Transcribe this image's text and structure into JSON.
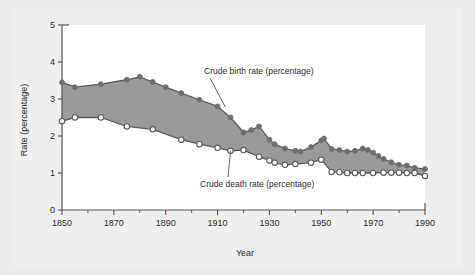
{
  "figure": {
    "background_color": "#ebebeb",
    "panel_color": "#efefef",
    "plot_area_color": "#ffffff",
    "axis_color": "#555555"
  },
  "chart_data": {
    "type": "line",
    "title": "",
    "xlabel": "Year",
    "ylabel": "Rate (percentage)",
    "xlim": [
      1850,
      1990
    ],
    "ylim": [
      0,
      5
    ],
    "xticks": [
      1850,
      1870,
      1890,
      1910,
      1930,
      1950,
      1970,
      1990
    ],
    "xtick_labels": [
      "1850",
      "1870",
      "1890",
      "1910",
      "1930",
      "1950",
      "1970",
      "1990"
    ],
    "x_minor_ticks": [
      1860,
      1880,
      1900,
      1920,
      1940,
      1960,
      1980
    ],
    "yticks": [
      0,
      1,
      2,
      3,
      4,
      5
    ],
    "ytick_labels": [
      "0",
      "1",
      "2",
      "3",
      "4",
      "5"
    ],
    "grid": false,
    "legend": "none",
    "fill_between_color": "#9a9a9a",
    "annotations": [
      {
        "text": "Crude birth rate (percentage)",
        "x_px": 204,
        "y_px": 74,
        "leader_to_x": 1913,
        "leader_to_y": 2.78
      },
      {
        "text": "Crude death rate (percentage)",
        "x_px": 200,
        "y_px": 187,
        "leader_to_x": 1915,
        "leader_to_y": 1.6
      }
    ],
    "series": [
      {
        "name": "Crude birth rate (percentage)",
        "marker": "filled-circle",
        "marker_color": "#6e6e6e",
        "line_color": "#5a5a5a",
        "x": [
          1850,
          1855,
          1865,
          1875,
          1880,
          1885,
          1890,
          1896,
          1903,
          1910,
          1915,
          1920,
          1923,
          1926,
          1930,
          1932,
          1936,
          1940,
          1942,
          1946,
          1950,
          1951,
          1954,
          1957,
          1960,
          1963,
          1966,
          1968,
          1970,
          1972,
          1974,
          1977,
          1980,
          1983,
          1986,
          1990
        ],
        "values": [
          3.45,
          3.32,
          3.4,
          3.52,
          3.6,
          3.46,
          3.32,
          3.16,
          2.98,
          2.8,
          2.5,
          2.1,
          2.16,
          2.26,
          1.9,
          1.78,
          1.66,
          1.6,
          1.58,
          1.7,
          1.88,
          1.93,
          1.65,
          1.62,
          1.58,
          1.6,
          1.66,
          1.62,
          1.55,
          1.46,
          1.38,
          1.29,
          1.22,
          1.2,
          1.14,
          1.11
        ]
      },
      {
        "name": "Crude death rate (percentage)",
        "marker": "open-circle",
        "marker_color": "#ffffff",
        "marker_edge_color": "#5a5a5a",
        "line_color": "#5a5a5a",
        "x": [
          1850,
          1855,
          1865,
          1875,
          1885,
          1896,
          1903,
          1910,
          1915,
          1920,
          1926,
          1930,
          1932,
          1936,
          1940,
          1946,
          1950,
          1954,
          1957,
          1960,
          1963,
          1966,
          1970,
          1974,
          1977,
          1980,
          1983,
          1986,
          1990
        ],
        "values": [
          2.4,
          2.5,
          2.5,
          2.26,
          2.18,
          1.9,
          1.78,
          1.68,
          1.6,
          1.62,
          1.44,
          1.34,
          1.28,
          1.22,
          1.24,
          1.28,
          1.36,
          1.03,
          1.02,
          1.0,
          1.0,
          1.0,
          1.0,
          1.01,
          1.01,
          1.01,
          1.0,
          1.0,
          0.92
        ]
      }
    ]
  }
}
